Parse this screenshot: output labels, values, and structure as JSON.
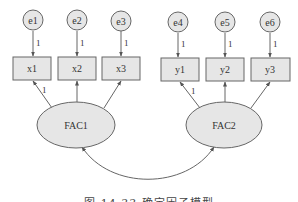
{
  "diagram": {
    "type": "confirmatory factor analysis path diagram",
    "colors": {
      "fill": "#e6e6e6",
      "stroke": "#666666",
      "text": "#333333"
    },
    "errors": [
      {
        "id": "e1",
        "label": "e1",
        "path_label": "1"
      },
      {
        "id": "e2",
        "label": "e2",
        "path_label": "1"
      },
      {
        "id": "e3",
        "label": "e3",
        "path_label": "1"
      },
      {
        "id": "e4",
        "label": "e4",
        "path_label": "1"
      },
      {
        "id": "e5",
        "label": "e5",
        "path_label": "1"
      },
      {
        "id": "e6",
        "label": "e6",
        "path_label": "1"
      }
    ],
    "observed": [
      {
        "id": "x1",
        "label": "x1"
      },
      {
        "id": "x2",
        "label": "x2"
      },
      {
        "id": "x3",
        "label": "x3"
      },
      {
        "id": "y1",
        "label": "y1"
      },
      {
        "id": "y2",
        "label": "y2"
      },
      {
        "id": "y3",
        "label": "y3"
      }
    ],
    "factors": [
      {
        "id": "FAC1",
        "label": "FAC1",
        "indicators": [
          "x1",
          "x2",
          "x3"
        ],
        "fixed_loading_label": "1"
      },
      {
        "id": "FAC2",
        "label": "FAC2",
        "indicators": [
          "y1",
          "y2",
          "y3"
        ],
        "fixed_loading_label": "1"
      }
    ],
    "covariance": {
      "from": "FAC1",
      "to": "FAC2"
    }
  },
  "caption": "图 14.33   确定因子模型"
}
